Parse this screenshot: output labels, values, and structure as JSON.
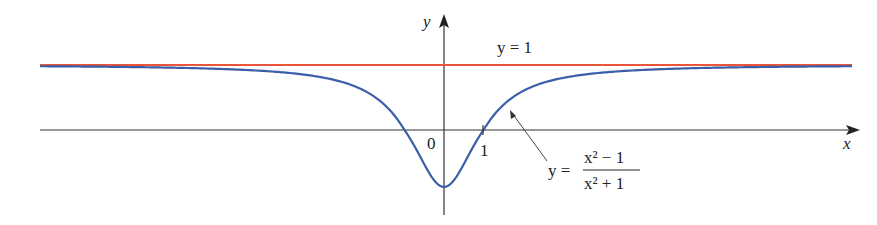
{
  "chart_data": {
    "type": "line",
    "title": "",
    "xlabel": "x",
    "ylabel": "y",
    "series": [
      {
        "name": "y = (x^2 - 1)/(x^2 + 1)",
        "color": "#3a5ea8",
        "function": "(x^2-1)/(x^2+1)",
        "x_range": [
          -10.1,
          10.5
        ]
      },
      {
        "name": "y = 1",
        "color": "#e8553a",
        "function": "1",
        "x_range": [
          -10.1,
          10.5
        ]
      }
    ],
    "sample_points": [
      {
        "x": -10,
        "y": 0.98
      },
      {
        "x": -3,
        "y": 0.8
      },
      {
        "x": -1,
        "y": 0
      },
      {
        "x": 0,
        "y": -1
      },
      {
        "x": 1,
        "y": 0
      },
      {
        "x": 3,
        "y": 0.8
      },
      {
        "x": 10,
        "y": 0.98
      }
    ],
    "tick_labels": {
      "origin": "0",
      "x1": "1"
    },
    "annotations": {
      "asymptote": "y = 1",
      "curve_label_lhs": "y =",
      "curve_label_num": "x² − 1",
      "curve_label_den": "x² + 1"
    },
    "grid": false,
    "legend": "none"
  }
}
